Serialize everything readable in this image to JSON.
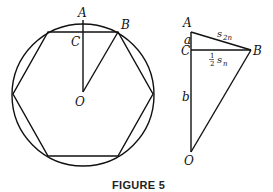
{
  "figure": {
    "caption": "FIGURE 5",
    "left_diagram": {
      "description": "Regular hexagon inscribed in a circle with center O",
      "labels": {
        "A": "A",
        "B": "B",
        "C": "C",
        "O": "O"
      }
    },
    "right_diagram": {
      "description": "Right triangle detail with vertices A, C, B, O",
      "labels": {
        "A": "A",
        "B": "B",
        "C": "C",
        "O": "O",
        "a": "a",
        "b": "b",
        "s": "s",
        "s2n_sub": "2n",
        "half_num": "1",
        "half_den": "2",
        "sn_s": "s",
        "sn_sub": "n"
      }
    }
  }
}
